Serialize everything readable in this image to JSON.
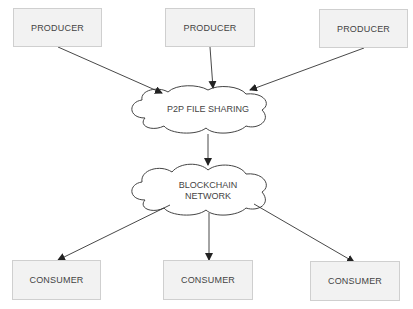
{
  "diagram": {
    "producers": [
      {
        "label": "PRODUCER"
      },
      {
        "label": "PRODUCER"
      },
      {
        "label": "PRODUCER"
      }
    ],
    "p2p": {
      "label": "P2P FILE SHARING"
    },
    "blockchain": {
      "line1": "BLOCKCHAIN",
      "line2": "NETWORK"
    },
    "consumers": [
      {
        "label": "CONSUMER"
      },
      {
        "label": "CONSUMER"
      },
      {
        "label": "CONSUMER"
      }
    ]
  }
}
